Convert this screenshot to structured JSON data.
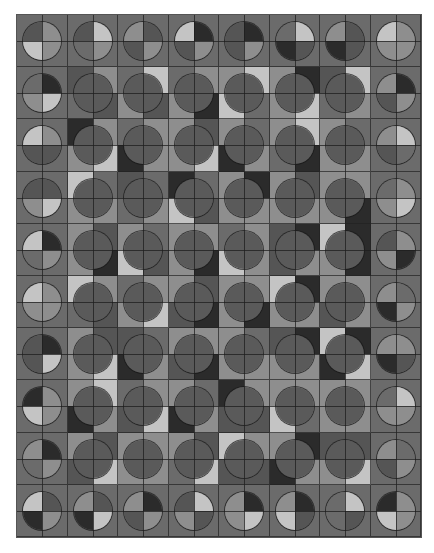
{
  "board": {
    "rows": 10,
    "cols": 8,
    "palette": [
      "#2b2b2b",
      "#555555",
      "#6b6b6b",
      "#8e8e8e",
      "#c4c4c4"
    ],
    "edge_background": 2,
    "inner_circle_color": "#5a5a5a",
    "cells": [
      [
        {
          "circle": [
            1,
            3,
            4,
            3
          ]
        },
        {
          "circle": [
            1,
            4,
            2,
            3
          ]
        },
        {
          "circle": [
            3,
            1,
            1,
            3
          ]
        },
        {
          "circle": [
            4,
            0,
            1,
            3
          ]
        },
        {
          "circle": [
            1,
            0,
            1,
            3
          ]
        },
        {
          "circle": [
            2,
            4,
            0,
            1
          ]
        },
        {
          "circle": [
            3,
            1,
            0,
            1
          ]
        },
        {
          "circle": [
            4,
            3,
            3,
            3
          ]
        }
      ],
      [
        {
          "circle": [
            2,
            0,
            3,
            4
          ]
        },
        {
          "bg": [
            1,
            3,
            2,
            1
          ]
        },
        {
          "bg": [
            2,
            4,
            3,
            1
          ]
        },
        {
          "bg": [
            2,
            3,
            3,
            0
          ]
        },
        {
          "bg": [
            3,
            4,
            4,
            2
          ]
        },
        {
          "bg": [
            3,
            0,
            3,
            4
          ]
        },
        {
          "bg": [
            1,
            4,
            2,
            3
          ]
        },
        {
          "circle": [
            3,
            0,
            1,
            3
          ]
        }
      ],
      [
        {
          "circle": [
            4,
            3,
            1,
            1
          ]
        },
        {
          "bg": [
            0,
            3,
            3,
            4
          ]
        },
        {
          "bg": [
            2,
            3,
            0,
            3
          ]
        },
        {
          "bg": [
            3,
            1,
            3,
            4
          ]
        },
        {
          "bg": [
            3,
            2,
            0,
            3
          ]
        },
        {
          "bg": [
            3,
            4,
            2,
            0
          ]
        },
        {
          "bg": [
            3,
            2,
            3,
            3
          ]
        },
        {
          "circle": [
            3,
            4,
            1,
            2
          ]
        }
      ],
      [
        {
          "circle": [
            1,
            1,
            3,
            4
          ]
        },
        {
          "bg": [
            4,
            2,
            3,
            3
          ]
        },
        {
          "bg": [
            1,
            2,
            2,
            3
          ]
        },
        {
          "bg": [
            0,
            2,
            4,
            1
          ]
        },
        {
          "bg": [
            3,
            0,
            3,
            3
          ]
        },
        {
          "bg": [
            3,
            1,
            3,
            3
          ]
        },
        {
          "bg": [
            3,
            3,
            3,
            0
          ]
        },
        {
          "circle": [
            2,
            3,
            3,
            4
          ]
        }
      ],
      [
        {
          "circle": [
            4,
            0,
            2,
            3
          ]
        },
        {
          "bg": [
            3,
            1,
            3,
            0
          ]
        },
        {
          "bg": [
            3,
            2,
            4,
            1
          ]
        },
        {
          "bg": [
            3,
            3,
            3,
            0
          ]
        },
        {
          "bg": [
            2,
            3,
            4,
            3
          ]
        },
        {
          "bg": [
            1,
            0,
            1,
            3
          ]
        },
        {
          "bg": [
            4,
            0,
            3,
            0
          ]
        },
        {
          "circle": [
            1,
            3,
            3,
            0
          ]
        }
      ],
      [
        {
          "circle": [
            4,
            3,
            3,
            3
          ]
        },
        {
          "bg": [
            4,
            3,
            2,
            1
          ]
        },
        {
          "bg": [
            2,
            3,
            3,
            4
          ]
        },
        {
          "bg": [
            3,
            1,
            1,
            0
          ]
        },
        {
          "bg": [
            3,
            3,
            3,
            0
          ]
        },
        {
          "bg": [
            4,
            0,
            3,
            3
          ]
        },
        {
          "bg": [
            3,
            3,
            1,
            3
          ]
        },
        {
          "circle": [
            3,
            2,
            0,
            3
          ]
        }
      ],
      [
        {
          "circle": [
            1,
            0,
            1,
            4
          ]
        },
        {
          "bg": [
            3,
            1,
            3,
            4
          ]
        },
        {
          "bg": [
            1,
            2,
            0,
            3
          ]
        },
        {
          "bg": [
            3,
            3,
            1,
            0
          ]
        },
        {
          "bg": [
            3,
            2,
            3,
            3
          ]
        },
        {
          "bg": [
            1,
            0,
            3,
            3
          ]
        },
        {
          "bg": [
            4,
            0,
            0,
            4
          ]
        },
        {
          "circle": [
            3,
            3,
            0,
            1
          ]
        }
      ],
      [
        {
          "circle": [
            0,
            3,
            4,
            3
          ]
        },
        {
          "bg": [
            3,
            4,
            0,
            3
          ]
        },
        {
          "bg": [
            2,
            3,
            1,
            4
          ]
        },
        {
          "bg": [
            3,
            2,
            0,
            3
          ]
        },
        {
          "bg": [
            0,
            3,
            1,
            1
          ]
        },
        {
          "bg": [
            3,
            3,
            4,
            2
          ]
        },
        {
          "bg": [
            3,
            3,
            3,
            3
          ]
        },
        {
          "circle": [
            2,
            4,
            3,
            3
          ]
        }
      ],
      [
        {
          "circle": [
            3,
            0,
            2,
            3
          ]
        },
        {
          "bg": [
            3,
            1,
            1,
            4
          ]
        },
        {
          "bg": [
            3,
            3,
            3,
            3
          ]
        },
        {
          "bg": [
            3,
            1,
            2,
            4
          ]
        },
        {
          "bg": [
            4,
            3,
            1,
            1
          ]
        },
        {
          "bg": [
            3,
            0,
            0,
            3
          ]
        },
        {
          "bg": [
            1,
            1,
            3,
            4
          ]
        },
        {
          "circle": [
            3,
            2,
            1,
            3
          ]
        }
      ],
      [
        {
          "circle": [
            4,
            1,
            0,
            3
          ]
        },
        {
          "circle": [
            3,
            1,
            0,
            4
          ]
        },
        {
          "circle": [
            3,
            0,
            1,
            3
          ]
        },
        {
          "circle": [
            1,
            4,
            3,
            1
          ]
        },
        {
          "circle": [
            3,
            0,
            3,
            4
          ]
        },
        {
          "circle": [
            3,
            0,
            4,
            1
          ]
        },
        {
          "circle": [
            2,
            4,
            2,
            1
          ]
        },
        {
          "circle": [
            0,
            3,
            4,
            3
          ]
        }
      ]
    ]
  }
}
